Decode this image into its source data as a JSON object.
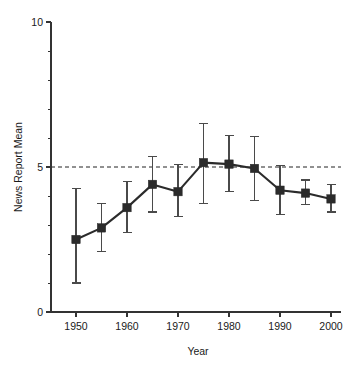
{
  "figure": {
    "background_color": "#ffffff",
    "ink_color": "#2b2b2b",
    "marker_color": "#2b2b2b",
    "errorbar_color": "#4a4a4a",
    "reference_line_color": "#222222"
  },
  "chart_data": {
    "type": "line",
    "title": "",
    "subtitle": "",
    "xlabel": "Year",
    "ylabel": "News Report Mean",
    "xlim": [
      1947,
      2002
    ],
    "ylim": [
      0,
      10
    ],
    "grid": false,
    "legend": null,
    "legend_position": "none",
    "x_tick_labels": [
      "1950",
      "1960",
      "1970",
      "1980",
      "1990",
      "2000"
    ],
    "x_ticks": [
      1950,
      1960,
      1970,
      1980,
      1990,
      2000
    ],
    "x_minor_ticks": [
      1955,
      1965,
      1975,
      1985,
      1995
    ],
    "y_tick_labels": [
      "0",
      "5",
      "10"
    ],
    "y_ticks": [
      0,
      5,
      10
    ],
    "y_minor_ticks": [
      1,
      2,
      3,
      4,
      6,
      7,
      8,
      9
    ],
    "reference_lines": [
      {
        "axis": "y",
        "value": 5,
        "style": "dashed"
      }
    ],
    "x": [
      1950,
      1955,
      1960,
      1965,
      1970,
      1975,
      1980,
      1985,
      1990,
      1995,
      2000
    ],
    "values": [
      2.5,
      2.9,
      3.6,
      4.4,
      4.15,
      5.15,
      5.1,
      4.95,
      4.2,
      4.1,
      3.9
    ],
    "error_low": [
      1.0,
      2.1,
      2.75,
      3.45,
      3.3,
      3.75,
      4.15,
      3.85,
      3.35,
      3.7,
      3.45
    ],
    "error_high": [
      4.25,
      3.75,
      4.5,
      5.35,
      5.1,
      6.5,
      6.1,
      6.05,
      5.05,
      4.55,
      4.4
    ],
    "series": [
      {
        "name": "News Report Mean",
        "marker": "square",
        "values": [
          2.5,
          2.9,
          3.6,
          4.4,
          4.15,
          5.15,
          5.1,
          4.95,
          4.2,
          4.1,
          3.9
        ]
      }
    ],
    "annotations": []
  }
}
